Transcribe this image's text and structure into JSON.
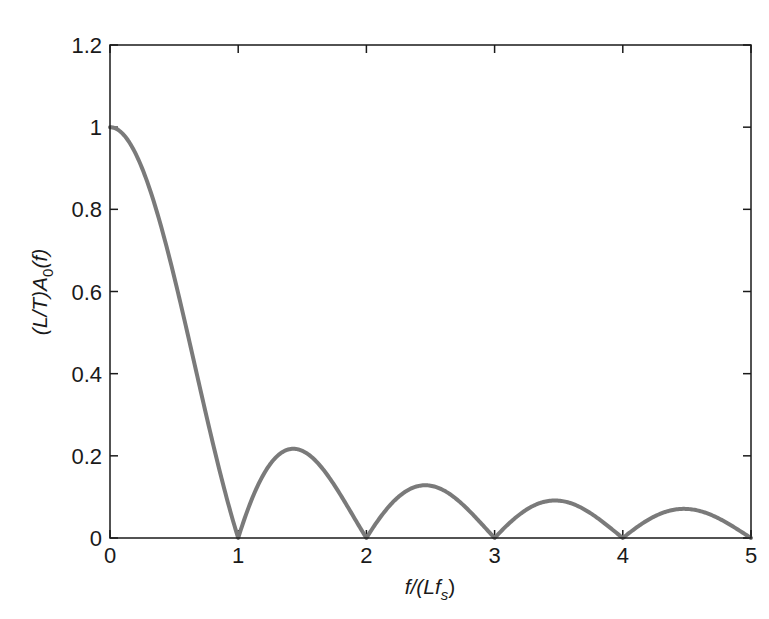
{
  "chart_data": {
    "type": "line",
    "title": "",
    "xlabel": "f/(Lf_s)",
    "ylabel": "(L/T)A_0(f)",
    "xlim": [
      0,
      5
    ],
    "ylim": [
      0,
      1.2
    ],
    "xticks": [
      0,
      1,
      2,
      3,
      4,
      5
    ],
    "xtick_labels": [
      "0",
      "1",
      "2",
      "3",
      "4",
      "5"
    ],
    "yticks": [
      0,
      0.2,
      0.4,
      0.6,
      0.8,
      1,
      1.2
    ],
    "ytick_labels": [
      "0",
      "0.2",
      "0.4",
      "0.6",
      "0.8",
      "1",
      "1.2"
    ],
    "grid": false,
    "legend": null,
    "series": [
      {
        "name": "|sinc(x)|",
        "color": "#7a7a7a",
        "function": "abs(sin(pi*x)/(pi*x))",
        "x": [
          0,
          0.1,
          0.2,
          0.3,
          0.4,
          0.5,
          0.6,
          0.7,
          0.8,
          0.9,
          1.0,
          1.1,
          1.2,
          1.3,
          1.43,
          1.6,
          1.7,
          1.8,
          1.9,
          2.0,
          2.2,
          2.46,
          2.7,
          2.8,
          3.0,
          3.2,
          3.47,
          3.7,
          3.8,
          4.0,
          4.2,
          4.48,
          4.7,
          4.8,
          5.0
        ],
        "values": [
          1.0,
          0.984,
          0.935,
          0.858,
          0.757,
          0.637,
          0.505,
          0.368,
          0.234,
          0.109,
          0.0,
          0.089,
          0.156,
          0.198,
          0.217,
          0.189,
          0.151,
          0.104,
          0.052,
          0.0,
          0.086,
          0.128,
          0.083,
          0.067,
          0.0,
          0.055,
          0.091,
          0.069,
          0.05,
          0.0,
          0.045,
          0.071,
          0.054,
          0.039,
          0.0
        ]
      }
    ]
  },
  "axes": {
    "xlabel_main": "f/(Lf",
    "xlabel_sub": "s",
    "xlabel_close": ")",
    "ylabel_prefix": "(L/T)A",
    "ylabel_sub": "0",
    "ylabel_suffix": "(f)"
  }
}
